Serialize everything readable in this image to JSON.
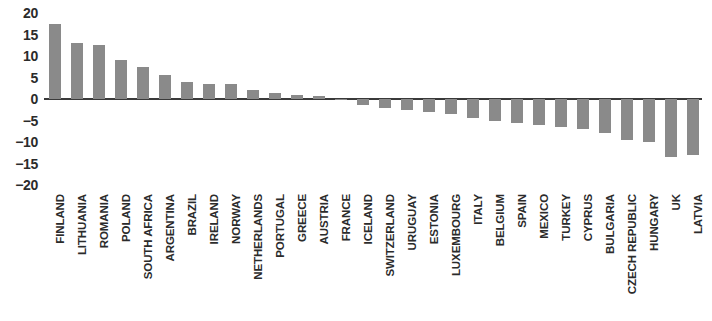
{
  "chart_data": {
    "type": "bar",
    "title": "",
    "subtitle": "",
    "xlabel": "",
    "ylabel": "",
    "ylim": [
      -20,
      20
    ],
    "yticks": [
      20,
      15,
      10,
      5,
      0,
      -5,
      -10,
      -15,
      -20
    ],
    "ytick_labels": [
      "20",
      "15",
      "10",
      "5",
      "0",
      "−5",
      "−10",
      "−15",
      "−20"
    ],
    "grid": false,
    "legend": "none",
    "bar_color": "#8a8a8a",
    "axis_color": "#3a3a3a",
    "categories": [
      "FINLAND",
      "LITHUANIA",
      "ROMANIA",
      "POLAND",
      "SOUTH AFRICA",
      "ARGENTINA",
      "BRAZIL",
      "IRELAND",
      "NORWAY",
      "NETHERLANDS",
      "PORTUGAL",
      "GREECE",
      "AUSTRIA",
      "FRANCE",
      "ICELAND",
      "SWITZERLAND",
      "URUGUAY",
      "ESTONIA",
      "LUXEMBOURG",
      "ITALY",
      "BELGIUM",
      "SPAIN",
      "MEXICO",
      "TURKEY",
      "CYPRUS",
      "BULGARIA",
      "CZECH REPUBLIC",
      "HUNGARY",
      "UK",
      "LATVIA"
    ],
    "values": [
      17.5,
      13.0,
      12.5,
      9.0,
      7.5,
      5.5,
      4.0,
      3.5,
      3.5,
      2.0,
      1.5,
      1.0,
      0.7,
      -0.3,
      -1.5,
      -2.0,
      -2.5,
      -3.0,
      -3.5,
      -4.5,
      -5.0,
      -5.5,
      -6.0,
      -6.5,
      -7.0,
      -8.0,
      -9.5,
      -10.0,
      -13.5,
      -13.0
    ]
  }
}
